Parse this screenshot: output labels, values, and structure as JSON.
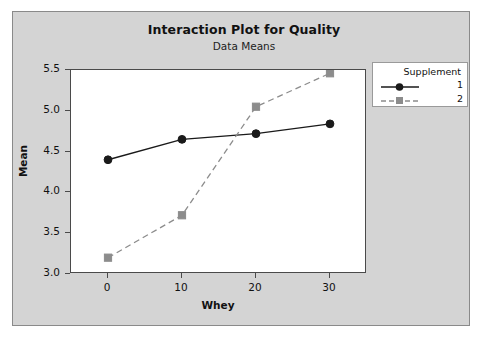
{
  "chart_data": {
    "type": "line",
    "title": "Interaction Plot for Quality",
    "subtitle": "Data Means",
    "xlabel": "Whey",
    "ylabel": "Mean",
    "x": [
      0,
      10,
      20,
      30
    ],
    "xticklabels": [
      "0",
      "10",
      "20",
      "30"
    ],
    "yticklabels": [
      "3.0",
      "3.5",
      "4.0",
      "4.5",
      "5.0",
      "5.5"
    ],
    "yticks": [
      3.0,
      3.5,
      4.0,
      4.5,
      5.0,
      5.5
    ],
    "xlim": [
      -5,
      35
    ],
    "ylim": [
      3.0,
      5.5
    ],
    "grid": false,
    "legend_position": "right-top",
    "legend_title": "Supplement",
    "series": [
      {
        "name": "1",
        "values": [
          4.4,
          4.65,
          4.72,
          4.84
        ],
        "color": "#1a1a1a",
        "linestyle": "solid",
        "marker": "circle"
      },
      {
        "name": "2",
        "values": [
          3.2,
          3.72,
          5.05,
          5.46
        ],
        "color": "#8c8c8c",
        "linestyle": "dashed",
        "marker": "square"
      }
    ]
  },
  "colors": {
    "panel_background": "#d4d4d4",
    "plot_background": "#ffffff",
    "axis": "#4a4a4a",
    "series1": "#1a1a1a",
    "series2": "#8c8c8c"
  },
  "icons": {
    "series1_marker": "filled-circle-marker",
    "series2_marker": "filled-square-marker"
  }
}
